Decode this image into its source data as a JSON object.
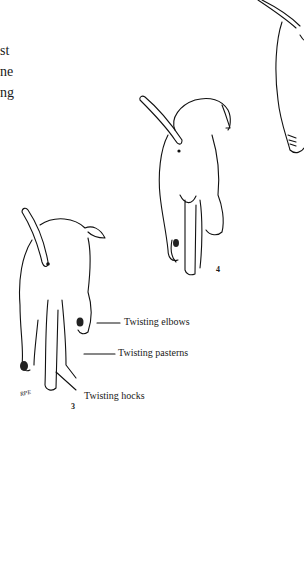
{
  "text_fragments": [
    "st",
    "ne",
    "ng"
  ],
  "figure": {
    "labels": {
      "elbows": "Twisting elbows",
      "pasterns": "Twisting pasterns",
      "hocks": "Twisting hocks"
    },
    "numbers": {
      "fig3": "3",
      "fig4": "4"
    },
    "signature": "RPE"
  }
}
